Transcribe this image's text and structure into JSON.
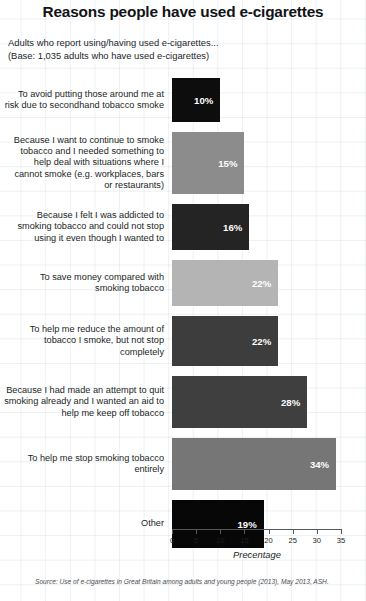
{
  "chart_data": {
    "type": "bar",
    "orientation": "horizontal",
    "title": "Reasons people have used e-cigarettes",
    "subtitle_line1": "Adults who report using/having used e-cigarettes...",
    "subtitle_line2": "(Base: 1,035 adults who have used e-cigarettes)",
    "xlabel": "Precentage",
    "ylabel": "",
    "xlim": [
      0,
      35
    ],
    "xticks": [
      0,
      5,
      10,
      15,
      20,
      25,
      30,
      35
    ],
    "xtick_labels": [
      "0",
      "5",
      "10",
      "15",
      "20",
      "25",
      "30",
      "35"
    ],
    "grid": false,
    "legend": "none",
    "source": "Source: Use of e-cigarettes in Great Britain among adults and young people (2013), May 2013, ASH.",
    "categories": [
      "To avoid putting those around me at risk due to secondhand tobacco smoke",
      "Because I want to continue to smoke tobacco and I needed something to help deal with situations where I cannot smoke (e.g. workplaces, bars or restaurants)",
      "Because I felt I was addicted to smoking tobacco and could not stop using it even though I wanted to",
      "To save money compared with smoking tobacco",
      "To help me reduce the amount of tobacco I smoke, but not stop completely",
      "Because I had made an attempt to quit smoking already and I wanted an aid to help me keep off tobacco",
      "To help me stop smoking tobacco entirely",
      "Other"
    ],
    "values": [
      10,
      15,
      16,
      22,
      22,
      28,
      34,
      19
    ],
    "value_labels": [
      "10%",
      "15%",
      "16%",
      "22%",
      "22%",
      "28%",
      "34%",
      "19%"
    ],
    "bar_colors": [
      "#0d0d0d",
      "#8c8c8c",
      "#242424",
      "#b4b4b4",
      "#3d3d3d",
      "#3f3f3f",
      "#767676",
      "#070707"
    ]
  }
}
